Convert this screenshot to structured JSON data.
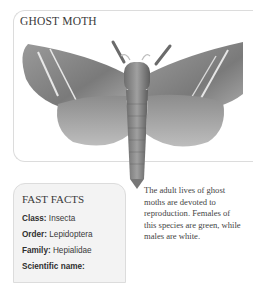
{
  "header": {
    "title": "GHOST MOTH"
  },
  "illustration": {
    "subject": "ghost-moth-illustration",
    "style": "pencil drawing, greyscale"
  },
  "fast_facts": {
    "title": "FAST FACTS",
    "items": [
      {
        "label": "Class:",
        "value": "Insecta"
      },
      {
        "label": "Order:",
        "value": "Lepidoptera"
      },
      {
        "label": "Family:",
        "value": "Hepialidae"
      },
      {
        "label": "Scientific name:",
        "value": ""
      }
    ]
  },
  "description": {
    "text": "The adult lives of ghost moths are devoted to reproduction. Females of this species are green, while males are white."
  },
  "colors": {
    "panel_border": "#dcdcdc",
    "facts_background": "#f3f3f3",
    "text": "#3a3a3a"
  }
}
